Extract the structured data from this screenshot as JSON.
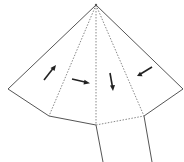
{
  "diagram": {
    "colors": {
      "background": "#ffffff",
      "outline": "#555555",
      "fold": "#888888",
      "arrow": "#222222"
    },
    "vertices": {
      "apex": [
        96,
        5
      ],
      "left": [
        8,
        89
      ],
      "lower_left": [
        49,
        116
      ],
      "bottom_center": [
        96,
        125
      ],
      "lower_right": [
        144,
        116
      ],
      "right": [
        183,
        89
      ],
      "tail_left_end": [
        103,
        162
      ],
      "tail_right_end": [
        152,
        162
      ]
    },
    "arrows": [
      {
        "label": "arrow-up-right",
        "from": [
          44,
          80
        ],
        "to": [
          55,
          66
        ]
      },
      {
        "label": "arrow-right",
        "from": [
          72,
          79
        ],
        "to": [
          89,
          83
        ]
      },
      {
        "label": "arrow-down",
        "from": [
          110,
          73
        ],
        "to": [
          113,
          90
        ]
      },
      {
        "label": "arrow-down-left",
        "from": [
          152,
          67
        ],
        "to": [
          137,
          76
        ]
      }
    ]
  }
}
